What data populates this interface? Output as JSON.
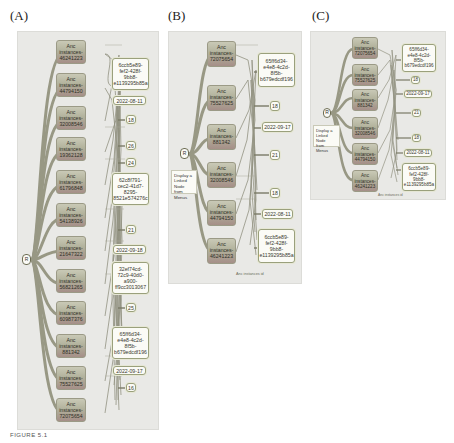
{
  "figure": {
    "caption": "FIGURE 5.1",
    "colors": {
      "frame_bg": "#e9e9e6",
      "instance_node": "#b2b29c",
      "edge": "#8e8e7a",
      "value_node_bg": "#fbfbf6",
      "value_node_border": "#9aa07c"
    }
  },
  "panels": [
    {
      "label": "(A)",
      "root_label": "R",
      "instances": [
        {
          "title": "Anc",
          "line2": "instances-",
          "id": "46241223"
        },
        {
          "title": "Anc",
          "line2": "instances-",
          "id": "44794150"
        },
        {
          "title": "Anc",
          "line2": "instances-",
          "id": "32008546"
        },
        {
          "title": "Anc",
          "line2": "instances-",
          "id": "19362128"
        },
        {
          "title": "Anc",
          "line2": "instances-",
          "id": "61796848"
        },
        {
          "title": "Anc",
          "line2": "instances-",
          "id": "54138926"
        },
        {
          "title": "Anc",
          "line2": "instances-",
          "id": "21647322"
        },
        {
          "title": "Anc",
          "line2": "instances-",
          "id": "56821265"
        },
        {
          "title": "Anc",
          "line2": "instances-",
          "id": "60987376"
        },
        {
          "title": "Anc",
          "line2": "instances-",
          "id": "881342"
        },
        {
          "title": "Anc",
          "line2": "instances-",
          "id": "75527625"
        },
        {
          "title": "Anc",
          "line2": "instances-",
          "id": "72075654"
        }
      ],
      "values": [
        {
          "text": "6ccb5e89-\nfef2-428f-\n9bb8-\ne1139295b85a"
        },
        {
          "text": "2022-08-11"
        },
        {
          "text": "18"
        },
        {
          "text": "26"
        },
        {
          "text": "24"
        },
        {
          "text": "62c8f791-\ncec2-41d7-\n8295-\n8521e574276c"
        },
        {
          "text": "21"
        },
        {
          "text": "2022-09-18"
        },
        {
          "text": "32ef74cd-\n72c9-40d0-\na900-\nff9cc3013067"
        },
        {
          "text": "25"
        },
        {
          "text": "65ff6d34-\ne4e8-4c2d-\n8f5b-\nb679edcdf196"
        },
        {
          "text": "2022-09-17"
        },
        {
          "text": "16"
        }
      ],
      "axis_label": ""
    },
    {
      "label": "(B)",
      "root_label": "R",
      "legend": "Display a\nLinked Node\nfrom Menus",
      "instances": [
        {
          "title": "Anc",
          "line2": "instances-",
          "id": "72075654"
        },
        {
          "title": "Anc",
          "line2": "instances-",
          "id": "75527625"
        },
        {
          "title": "Anc",
          "line2": "instances-",
          "id": "881342"
        },
        {
          "title": "Anc",
          "line2": "instances-",
          "id": "32008546"
        },
        {
          "title": "Anc",
          "line2": "instances-",
          "id": "44794150"
        },
        {
          "title": "Anc",
          "line2": "instances-",
          "id": "46241223"
        }
      ],
      "values": [
        {
          "text": "65ff6d34-\ne4e8-4c2d-\n8f5b-\nb679edcdf196"
        },
        {
          "text": "18"
        },
        {
          "text": "2022-09-17"
        },
        {
          "text": "21"
        },
        {
          "text": "18"
        },
        {
          "text": "2022-08-11"
        },
        {
          "text": "6ccb5e89-\nfef2-428f-\n9bb8-\ne1139295b85a"
        }
      ],
      "axis_label": "Anc instances id"
    },
    {
      "label": "(C)",
      "root_label": "R",
      "legend": "Display a\nLinked Node\nfrom Menus",
      "instances": [
        {
          "title": "Anc",
          "line2": "instances-",
          "id": "72075654"
        },
        {
          "title": "Anc",
          "line2": "instances-",
          "id": "75527625"
        },
        {
          "title": "Anc",
          "line2": "instances-",
          "id": "881342"
        },
        {
          "title": "Anc",
          "line2": "instances-",
          "id": "32008546"
        },
        {
          "title": "Anc",
          "line2": "instances-",
          "id": "44794150"
        },
        {
          "title": "Anc",
          "line2": "instances-",
          "id": "46241223"
        }
      ],
      "values": [
        {
          "text": "65ff6d34-\ne4e8-4c2d-\n8f5b-\nb679edcdf196"
        },
        {
          "text": "18"
        },
        {
          "text": "2022-09-17"
        },
        {
          "text": "21"
        },
        {
          "text": "18"
        },
        {
          "text": "2022-08-11"
        },
        {
          "text": "6ccb5e89-\nfef2-428f-\n9bb8-\ne1139295b85a"
        }
      ],
      "axis_label": "Anc instances id"
    }
  ]
}
